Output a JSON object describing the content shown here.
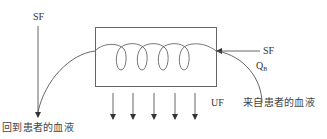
{
  "diagram": {
    "type": "hemofiltration-schematic",
    "labels": {
      "sf_top_left": "SF",
      "sf_right": "SF",
      "qb_main": "Q",
      "qb_sub": "B",
      "uf": "UF",
      "blood_return": "回到患者的血液",
      "blood_from": "来自患者的血液"
    },
    "elements": {
      "filter_box": "filter-chamber",
      "coil": "blood-coil",
      "down_arrows_count": 5
    },
    "colors": {
      "stroke": "#555555",
      "text": "#333333",
      "background": "#ffffff"
    }
  }
}
